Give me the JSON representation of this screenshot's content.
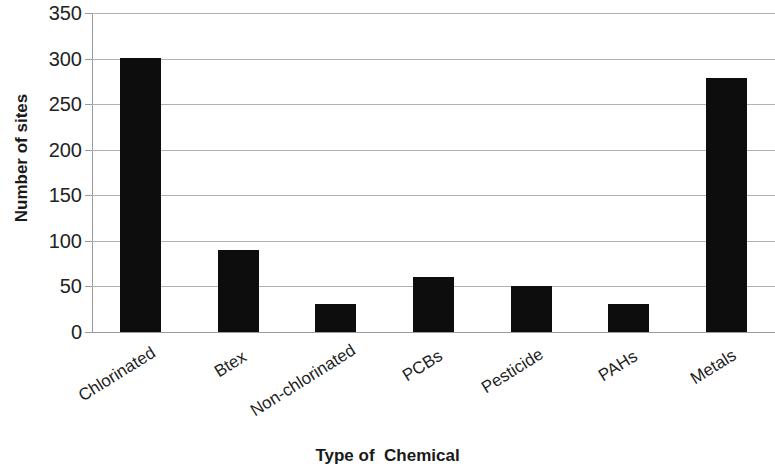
{
  "chart_data": {
    "type": "bar",
    "title": "",
    "xlabel": "Type of  Chemical",
    "ylabel": "Number of sites",
    "categories": [
      "Chlorinated",
      "Btex",
      "Non-chlorinated",
      "PCBs",
      "Pesticide",
      "PAHs",
      "Metals"
    ],
    "values": [
      301,
      90,
      31,
      60,
      51,
      31,
      279
    ],
    "ylim": [
      0,
      350
    ],
    "yticks": [
      0,
      50,
      100,
      150,
      200,
      250,
      300,
      350
    ],
    "ytick_labels": [
      "0",
      "50",
      "100",
      "150",
      "200",
      "250",
      "300",
      "350"
    ],
    "grid": true,
    "legend": false,
    "bar_color": "#0d0d0d",
    "grid_color": "#b2b2b2",
    "axis_color": "#9a9a9a",
    "x_label_rotation": -32
  },
  "axes": {
    "y_title": "Number of sites",
    "x_title": "Type of  Chemical"
  }
}
